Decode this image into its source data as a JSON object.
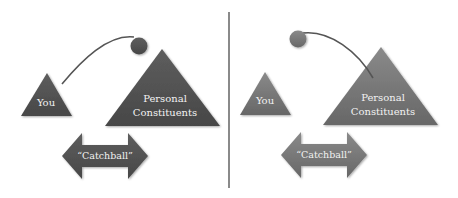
{
  "diagram": {
    "divider": {
      "x": 229,
      "y1": 12,
      "y2": 188,
      "color": "#8a8a8a"
    },
    "panels": [
      {
        "id": "left",
        "color_dark": "#4f4f4f",
        "color_light": "#6a6a6a",
        "you_label": "You",
        "constituents_label_line1": "Personal",
        "constituents_label_line2": "Constituents",
        "arrow_label": "“Catchball”",
        "ball_position": "near constituents",
        "description": "Ball thrown from You toward Personal Constituents"
      },
      {
        "id": "right",
        "color_dark": "#6c6c6c",
        "color_light": "#8c8c8c",
        "you_label": "You",
        "constituents_label_line1": "Personal",
        "constituents_label_line2": "Constituents",
        "arrow_label": "“Catchball”",
        "ball_position": "near you",
        "description": "Ball thrown back from Personal Constituents toward You"
      }
    ]
  }
}
